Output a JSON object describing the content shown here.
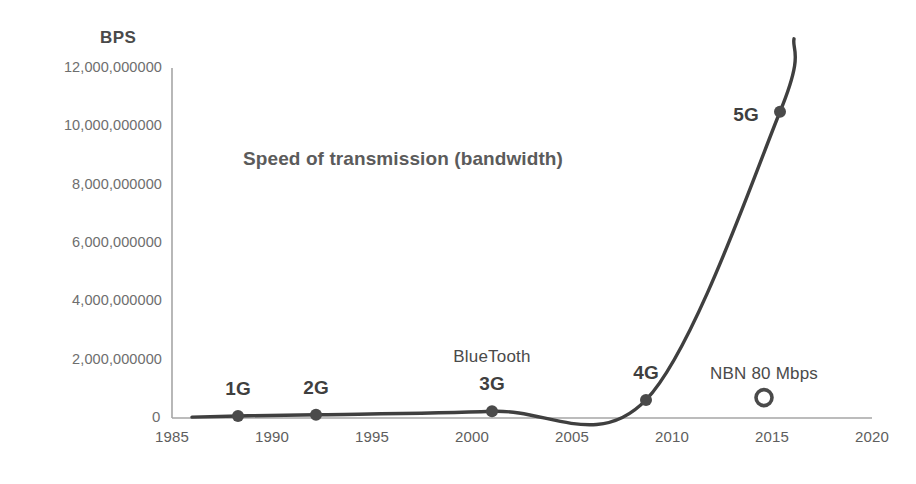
{
  "chart_data": {
    "type": "line",
    "title": "Speed of transmission (bandwidth)",
    "xlabel": "",
    "ylabel": "BPS",
    "xlim": [
      1985,
      2020
    ],
    "ylim": [
      0,
      12000000000
    ],
    "grid": false,
    "legend": "none",
    "x_ticks": [
      "1985",
      "1990",
      "1995",
      "2000",
      "2005",
      "2010",
      "2015",
      "2020"
    ],
    "x_tick_values": [
      1985,
      1990,
      1995,
      2000,
      2005,
      2010,
      2015,
      2020
    ],
    "y_ticks": [
      "2,000,000000",
      "4,000,000000",
      "6,000,000000",
      "8,000,000000",
      "10,000,000000",
      "12,000,000000"
    ],
    "y_tick_values": [
      2000000000,
      4000000000,
      6000000000,
      8000000000,
      10000000000,
      12000000000
    ],
    "origin_label": "0",
    "series": [
      {
        "name": "Speed of transmission",
        "x": [
          1986,
          1988.3,
          1992.2,
          2001,
          2008.7,
          2015.4,
          2016.1
        ],
        "values": [
          30000000,
          70000000,
          110000000,
          230000000,
          620000000,
          10500000000,
          13000000000
        ]
      }
    ],
    "annotations": [
      {
        "label": "1G",
        "x": 1988.3,
        "y": 70000000,
        "marker": "filled",
        "bold": true,
        "label_dy": -26
      },
      {
        "label": "2G",
        "x": 1992.2,
        "y": 110000000,
        "marker": "filled",
        "bold": true,
        "label_dy": -26
      },
      {
        "label": "BlueTooth",
        "x": 2001.0,
        "y": 230000000,
        "marker": "none",
        "bold": false,
        "label_dy": -52
      },
      {
        "label": "3G",
        "x": 2001.0,
        "y": 230000000,
        "marker": "filled",
        "bold": true,
        "label_dy": -26
      },
      {
        "label": "4G",
        "x": 2008.7,
        "y": 620000000,
        "marker": "filled",
        "bold": true,
        "label_dy": -26
      },
      {
        "label": "5G",
        "x": 2015.4,
        "y": 10500000000,
        "marker": "filled",
        "bold": true,
        "label_dy": 4,
        "label_dx": -34
      },
      {
        "label": "NBN 80 Mbps",
        "x": 2014.6,
        "y": 700000000,
        "marker": "hollow",
        "bold": false,
        "label_dy": -22
      }
    ],
    "colors": {
      "curve": "#3f3f3f",
      "axis": "#a6a6a6",
      "text": "#5e5e5e",
      "title": "#5b5b5b",
      "marker": "#4a4a4a",
      "background": "#ffffff"
    }
  }
}
